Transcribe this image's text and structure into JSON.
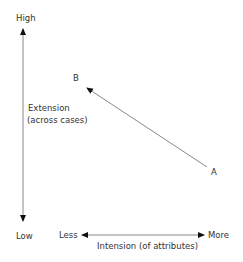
{
  "diagram": {
    "y_axis": {
      "top_label": "High",
      "bottom_label": "Low",
      "title_line1": "Extension",
      "title_line2": "(across cases)"
    },
    "x_axis": {
      "left_label": "Less",
      "right_label": "More",
      "title": "Intension (of attributes)"
    },
    "points": [
      {
        "label": "A"
      },
      {
        "label": "B"
      }
    ],
    "colors": {
      "line": "#888888",
      "arrowhead": "#111111",
      "text": "#333333"
    }
  }
}
